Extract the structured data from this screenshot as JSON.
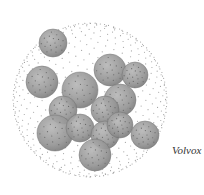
{
  "figure": {
    "caption": "Volvox",
    "colors": {
      "dot": "#8a8a8a",
      "daughter_fill": "#9a9a9a",
      "daughter_edge": "#6f6f6f",
      "caption": "#333333"
    },
    "daughter_colony_count": 14
  }
}
